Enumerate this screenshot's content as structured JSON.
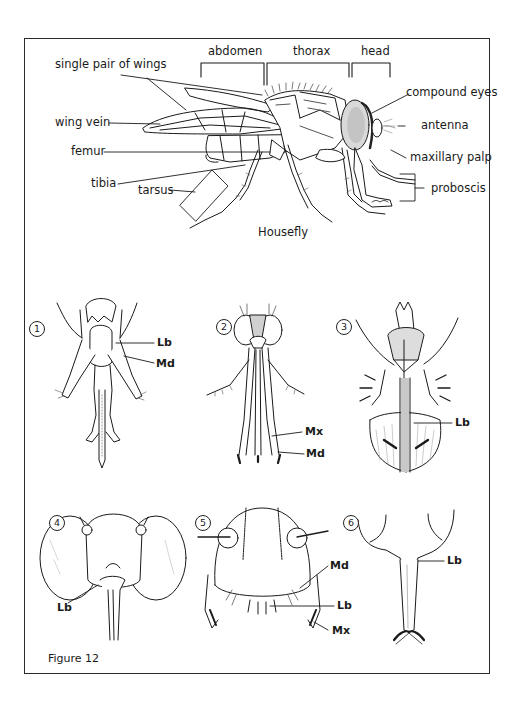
{
  "figure": {
    "caption": "Figure 12",
    "main_title": "Housefly",
    "regions": {
      "abdomen": "abdomen",
      "thorax": "thorax",
      "head": "head"
    },
    "housefly_labels": {
      "wings": "single pair of wings",
      "wing_vein": "wing vein",
      "femur": "femur",
      "tibia": "tibia",
      "tarsus": "tarsus",
      "compound_eyes": "compound eyes",
      "antenna": "antenna",
      "maxillary_palp": "maxillary palp",
      "proboscis": "proboscis"
    },
    "panels": [
      {
        "number": "1",
        "labels": [
          "Lb",
          "Md"
        ]
      },
      {
        "number": "2",
        "labels": [
          "Mx",
          "Md"
        ]
      },
      {
        "number": "3",
        "labels": [
          "Lb"
        ]
      },
      {
        "number": "4",
        "labels": [
          "Lb"
        ]
      },
      {
        "number": "5",
        "labels": [
          "Md",
          "Lb",
          "Mx"
        ]
      },
      {
        "number": "6",
        "labels": [
          "Lb"
        ]
      }
    ],
    "colors": {
      "ink": "#1a1a1a",
      "frame": "#2b2b2b",
      "background": "#ffffff",
      "stipple": "#bdbdbd"
    }
  }
}
